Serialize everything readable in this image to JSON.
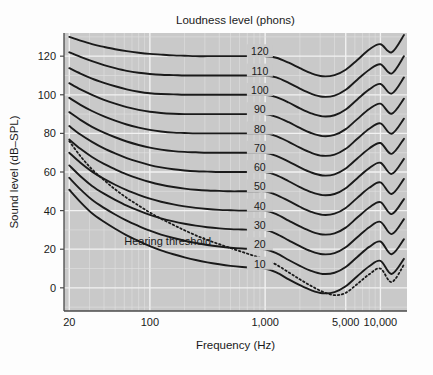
{
  "figure": {
    "background": "#fdfdfd",
    "plot_background": "#c9c9c9",
    "gridline_color": "#e2e2e2",
    "axis_color": "#4a4a4a",
    "curve_color": "#1a1a1a"
  },
  "header": {
    "title": "Loudness level (phons)"
  },
  "axes": {
    "x_title": "Frequency (Hz)",
    "y_title": "Sound level (dB–SPL)",
    "x_ticks": [
      {
        "label": "20",
        "value": 20
      },
      {
        "label": "100",
        "value": 100
      },
      {
        "label": "1,000",
        "value": 1000
      },
      {
        "label": "5,000",
        "value": 5000
      },
      {
        "label": "10,000",
        "value": 10000
      }
    ],
    "y_ticks": [
      {
        "label": "0",
        "value": 0
      },
      {
        "label": "20",
        "value": 20
      },
      {
        "label": "40",
        "value": 40
      },
      {
        "label": "60",
        "value": 60
      },
      {
        "label": "80",
        "value": 80
      },
      {
        "label": "100",
        "value": 100
      },
      {
        "label": "120",
        "value": 120
      }
    ]
  },
  "annotations": [
    {
      "name": "hearing-threshold-label",
      "text": "Hearing threshold",
      "x": 60,
      "y": 22
    }
  ],
  "chart_data": {
    "type": "line",
    "title": "Loudness level (phons)",
    "xlabel": "Frequency (Hz)",
    "ylabel": "Sound level (dB–SPL)",
    "xscale": "log",
    "xlim": [
      18,
      17000
    ],
    "ylim": [
      -12,
      132
    ],
    "grid": true,
    "legend": "inline-curve-labels",
    "x": [
      20,
      25,
      31.5,
      40,
      50,
      63,
      80,
      100,
      125,
      160,
      200,
      250,
      315,
      400,
      500,
      630,
      800,
      1000,
      1250,
      1600,
      2000,
      2500,
      3150,
      4000,
      5000,
      6300,
      8000,
      10000,
      12500,
      16000
    ],
    "series": [
      {
        "name": "120",
        "label": "120 phons",
        "phon": 120,
        "label_pos": {
          "x": 900,
          "y": 122
        },
        "values": [
          130.0,
          128.0,
          126.2,
          124.8,
          123.6,
          122.6,
          121.8,
          121.2,
          120.8,
          120.4,
          120.2,
          120.0,
          120.0,
          120.0,
          120.0,
          120.0,
          120.0,
          120.0,
          119.2,
          116.6,
          113.8,
          111.2,
          109.6,
          110.2,
          113.0,
          118.0,
          123.5,
          126.2,
          122.0,
          131.0
        ]
      },
      {
        "name": "110",
        "label": "110 phons",
        "phon": 110,
        "label_pos": {
          "x": 900,
          "y": 112
        },
        "values": [
          122.0,
          119.6,
          117.4,
          115.4,
          113.8,
          112.4,
          111.4,
          110.8,
          110.4,
          110.2,
          110.0,
          110.0,
          110.0,
          110.0,
          110.0,
          110.0,
          110.0,
          110.0,
          109.0,
          106.2,
          103.2,
          100.6,
          99.0,
          99.6,
          102.6,
          107.8,
          113.0,
          115.8,
          111.0,
          120.0
        ]
      },
      {
        "name": "100",
        "label": "100 phons",
        "phon": 100,
        "label_pos": {
          "x": 900,
          "y": 102
        },
        "values": [
          113.8,
          111.0,
          108.4,
          106.2,
          104.4,
          102.8,
          101.6,
          100.8,
          100.4,
          100.2,
          100.0,
          100.0,
          100.0,
          100.0,
          100.0,
          100.0,
          100.0,
          100.0,
          98.8,
          96.0,
          93.0,
          90.4,
          88.8,
          89.4,
          92.4,
          97.6,
          102.8,
          105.6,
          100.6,
          109.0
        ]
      },
      {
        "name": "90",
        "label": "90 phons",
        "phon": 90,
        "label_pos": {
          "x": 900,
          "y": 92
        },
        "values": [
          106.0,
          102.8,
          100.0,
          97.4,
          95.4,
          93.6,
          92.2,
          91.2,
          90.6,
          90.2,
          90.0,
          90.0,
          90.0,
          90.0,
          90.0,
          90.0,
          90.0,
          90.0,
          88.6,
          85.8,
          82.8,
          80.2,
          78.6,
          79.2,
          82.2,
          87.4,
          92.6,
          95.4,
          90.2,
          98.0
        ]
      },
      {
        "name": "80",
        "label": "80 phons",
        "phon": 80,
        "label_pos": {
          "x": 900,
          "y": 82
        },
        "values": [
          98.4,
          94.8,
          91.6,
          88.8,
          86.6,
          84.6,
          83.0,
          81.8,
          81.0,
          80.4,
          80.2,
          80.0,
          80.0,
          80.0,
          80.0,
          80.0,
          80.0,
          80.0,
          78.6,
          75.6,
          72.6,
          70.0,
          68.4,
          69.0,
          72.0,
          77.2,
          82.4,
          85.2,
          79.8,
          87.6
        ]
      },
      {
        "name": "70",
        "label": "70 phons",
        "phon": 70,
        "label_pos": {
          "x": 900,
          "y": 72
        },
        "values": [
          91.0,
          87.0,
          83.4,
          80.4,
          78.0,
          75.8,
          74.0,
          72.6,
          71.6,
          70.8,
          70.4,
          70.2,
          70.0,
          70.0,
          70.0,
          70.0,
          70.0,
          70.0,
          68.4,
          65.4,
          62.4,
          59.8,
          58.2,
          58.8,
          61.8,
          67.0,
          72.2,
          75.0,
          69.4,
          77.2
        ]
      },
      {
        "name": "60",
        "label": "60 phons",
        "phon": 60,
        "label_pos": {
          "x": 900,
          "y": 62
        },
        "values": [
          83.8,
          79.4,
          75.6,
          72.2,
          69.6,
          67.2,
          65.2,
          63.6,
          62.4,
          61.4,
          60.8,
          60.4,
          60.2,
          60.0,
          60.0,
          60.0,
          60.0,
          60.0,
          58.4,
          55.2,
          52.2,
          49.6,
          48.0,
          48.6,
          51.6,
          56.8,
          62.0,
          64.8,
          59.0,
          66.8
        ]
      },
      {
        "name": "50",
        "label": "50 phons",
        "phon": 50,
        "label_pos": {
          "x": 900,
          "y": 52
        },
        "values": [
          76.8,
          72.0,
          67.8,
          64.2,
          61.4,
          58.8,
          56.6,
          54.8,
          53.4,
          52.2,
          51.4,
          50.8,
          50.4,
          50.2,
          50.0,
          50.0,
          50.0,
          50.0,
          48.2,
          45.0,
          42.0,
          39.4,
          37.8,
          38.4,
          41.4,
          46.6,
          51.8,
          54.6,
          48.6,
          56.4
        ]
      },
      {
        "name": "40",
        "label": "40 phons",
        "phon": 40,
        "label_pos": {
          "x": 900,
          "y": 42
        },
        "values": [
          70.0,
          64.8,
          60.2,
          56.4,
          53.4,
          50.6,
          48.2,
          46.2,
          44.6,
          43.2,
          42.2,
          41.4,
          40.8,
          40.4,
          40.2,
          40.0,
          40.0,
          40.0,
          38.2,
          34.8,
          31.8,
          29.2,
          27.6,
          28.2,
          31.2,
          36.4,
          41.6,
          44.4,
          38.2,
          46.0
        ]
      },
      {
        "name": "30",
        "label": "30 phons",
        "phon": 30,
        "label_pos": {
          "x": 900,
          "y": 32
        },
        "values": [
          63.4,
          57.8,
          52.8,
          48.8,
          45.6,
          42.6,
          40.0,
          37.8,
          36.0,
          34.4,
          33.2,
          32.2,
          31.4,
          30.8,
          30.4,
          30.2,
          30.0,
          30.0,
          28.0,
          24.6,
          21.6,
          19.0,
          17.4,
          18.0,
          21.0,
          26.2,
          31.4,
          34.2,
          27.8,
          35.6
        ]
      },
      {
        "name": "20",
        "label": "20 phons",
        "phon": 20,
        "label_pos": {
          "x": 900,
          "y": 22
        },
        "values": [
          57.0,
          51.0,
          45.6,
          41.4,
          38.0,
          34.8,
          32.0,
          29.6,
          27.6,
          25.8,
          24.4,
          23.2,
          22.2,
          21.4,
          20.8,
          20.4,
          20.2,
          20.0,
          18.0,
          14.4,
          11.4,
          8.8,
          7.2,
          7.8,
          10.8,
          16.0,
          21.2,
          24.0,
          17.4,
          25.2
        ]
      },
      {
        "name": "10",
        "label": "10 phons",
        "phon": 10,
        "label_pos": {
          "x": 900,
          "y": 12
        },
        "values": [
          50.8,
          44.4,
          38.6,
          34.2,
          30.6,
          27.2,
          24.2,
          21.6,
          19.4,
          17.4,
          15.8,
          14.4,
          13.2,
          12.2,
          11.4,
          10.8,
          10.4,
          10.0,
          8.0,
          4.4,
          1.4,
          -1.2,
          -2.8,
          -2.2,
          0.8,
          6.0,
          11.2,
          14.0,
          7.2,
          15.0
        ]
      }
    ],
    "threshold_curve": {
      "name": "hearing-threshold",
      "label": "Hearing threshold",
      "style": "dotted",
      "values": [
        76.0,
        68.2,
        61.4,
        55.8,
        51.0,
        46.6,
        42.6,
        39.0,
        35.8,
        32.6,
        29.8,
        27.2,
        24.8,
        22.6,
        20.6,
        18.6,
        16.6,
        14.6,
        12.0,
        8.0,
        4.4,
        1.0,
        -2.0,
        -3.8,
        -2.6,
        2.0,
        7.0,
        10.0,
        3.0,
        12.0
      ]
    }
  }
}
